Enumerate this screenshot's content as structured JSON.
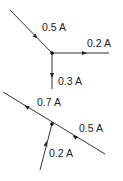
{
  "diagrams": [
    {
      "name": "junction-top",
      "junction": [
        52,
        53
      ],
      "branches": [
        {
          "current": "0.5 A",
          "direction": "into-junction",
          "from": [
            10,
            10
          ],
          "to": [
            52,
            53
          ],
          "arrow_at": [
            34,
            35
          ],
          "label_pos": [
            42,
            31
          ]
        },
        {
          "current": "0.2 A",
          "direction": "out-of-junction",
          "from": [
            52,
            53
          ],
          "to": [
            109,
            53
          ],
          "arrow_at": [
            84,
            53
          ],
          "label_pos": [
            87,
            47
          ]
        },
        {
          "current": "0.3 A",
          "direction": "out-of-junction",
          "from": [
            52,
            53
          ],
          "to": [
            52,
            89
          ],
          "arrow_at": [
            52,
            75
          ],
          "label_pos": [
            58,
            85
          ]
        }
      ]
    },
    {
      "name": "junction-bottom",
      "junction": [
        52,
        124
      ],
      "branches": [
        {
          "current": "0.7 A",
          "direction": "out-of-junction",
          "from": [
            52,
            124
          ],
          "to": [
            3,
            92
          ],
          "arrow_at": [
            27,
            107
          ],
          "label_pos": [
            37,
            106
          ]
        },
        {
          "current": "0.5 A",
          "direction": "into-junction",
          "from": [
            105,
            154
          ],
          "to": [
            52,
            124
          ],
          "arrow_at": [
            75,
            137
          ],
          "label_pos": [
            79,
            132
          ]
        },
        {
          "current": "0.2 A",
          "direction": "into-junction",
          "from": [
            40,
            170
          ],
          "to": [
            52,
            124
          ],
          "arrow_at": [
            46,
            144
          ],
          "label_pos": [
            49,
            157
          ]
        }
      ]
    }
  ],
  "labels": {
    "top_in": "0.5 A",
    "top_right": "0.2 A",
    "top_down": "0.3 A",
    "bottom_upleft": "0.7 A",
    "bottom_right": "0.5 A",
    "bottom_lower": "0.2 A"
  }
}
